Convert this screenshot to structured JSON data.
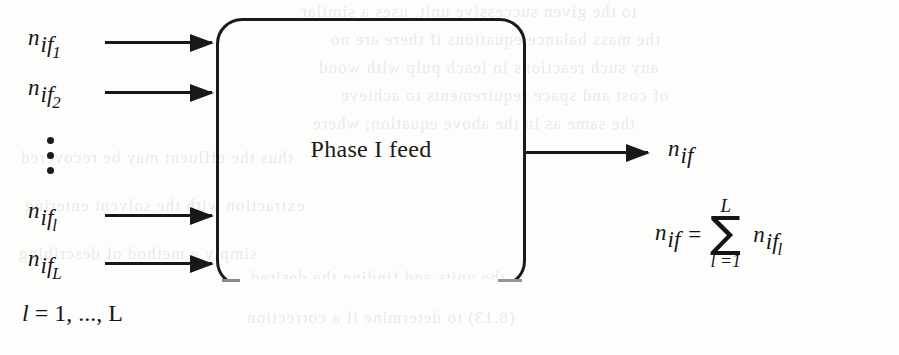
{
  "figure": {
    "type": "block-flow-diagram",
    "background_color": "#fdfdfc",
    "ink_color": "#181818"
  },
  "process_box": {
    "label": "Phase I feed"
  },
  "inputs": [
    {
      "name": "n_if_1",
      "base": "n",
      "sub": "if",
      "subsub": "1"
    },
    {
      "name": "n_if_2",
      "base": "n",
      "sub": "if",
      "subsub": "2"
    },
    {
      "name": "n_if_l",
      "base": "n",
      "sub": "if",
      "subsub": "l"
    },
    {
      "name": "n_if_L",
      "base": "n",
      "sub": "if",
      "subsub": "L"
    }
  ],
  "ellipsis": {
    "glyph": "vertical-dots",
    "count": 3
  },
  "output": {
    "name": "n_if",
    "base": "n",
    "sub": "if"
  },
  "equation": {
    "lhs_base": "n",
    "lhs_sub": "if",
    "equals": "=",
    "sigma": "∑",
    "upper_limit": "L",
    "lower_limit": "l =1",
    "term_base": "n",
    "term_sub": "if",
    "term_subsub": "l",
    "plain": "n_if = sum_{l=1}^{L} n_if_l"
  },
  "index_range": {
    "prefix": "l",
    "equals": "=",
    "text": "1, ..., L",
    "plain": "l = 1, ..., L"
  },
  "bleed_through": {
    "lines": [
      "to the given successive unit, uses a similar",
      "the mass balance equations if there are no",
      "any such reactions in leach pulp with wood",
      "of cost and space requirements to achieve",
      "the same as in the above equation; where",
      "thus the effluent may be recovered",
      "extraction with the solvent entering",
      "simply a method of describing",
      "the units and finding the desired",
      "(8.13) to determine if a correction"
    ]
  }
}
